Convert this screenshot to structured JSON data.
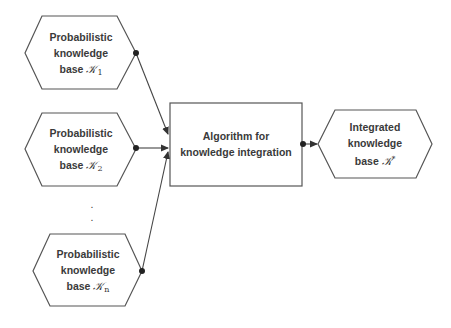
{
  "diagram": {
    "inputs": [
      {
        "line1": "Probabilistic",
        "line2": "knowledge",
        "line3_prefix": "base",
        "symbol": "𝒦",
        "index": "1"
      },
      {
        "line1": "Probabilistic",
        "line2": "knowledge",
        "line3_prefix": "base",
        "symbol": "𝒦",
        "index": "2"
      },
      {
        "line1": "Probabilistic",
        "line2": "knowledge",
        "line3_prefix": "base",
        "symbol": "𝒦",
        "index": "n"
      }
    ],
    "ellipsis": ".",
    "process": {
      "line1": "Algorithm for",
      "line2": "knowledge integration"
    },
    "output": {
      "line1": "Integrated",
      "line2": "knowledge",
      "line3_prefix": "base",
      "symbol": "𝒦",
      "superscript": "*"
    },
    "colors": {
      "stroke": "#555555",
      "text": "#3a3a3a",
      "background": "#ffffff",
      "dot": "#222222"
    }
  }
}
